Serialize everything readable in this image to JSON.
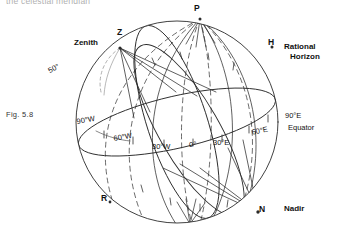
{
  "page": {
    "running_text": "the celestial meridian",
    "figure_number": "Fig. 5.8"
  },
  "diagram": {
    "points": {
      "pole": "P",
      "zenith_point": "Z",
      "zenith_label": "Zenith",
      "horizon_point": "H",
      "horizon_label_line1": "Rational",
      "horizon_label_line2": "Horizon",
      "nadir_point": "N",
      "nadir_label": "Nadir",
      "r_point": "R"
    },
    "angles": {
      "colatitude": "50°"
    },
    "equator": {
      "label": "Equator",
      "longitudes": [
        "90°W",
        "60°W",
        "30°W",
        "0°",
        "30°E",
        "60°E",
        "90°E"
      ]
    },
    "colors": {
      "stroke": "#2b2b2b",
      "faint": "#9a9a9a",
      "text": "#111111"
    }
  }
}
